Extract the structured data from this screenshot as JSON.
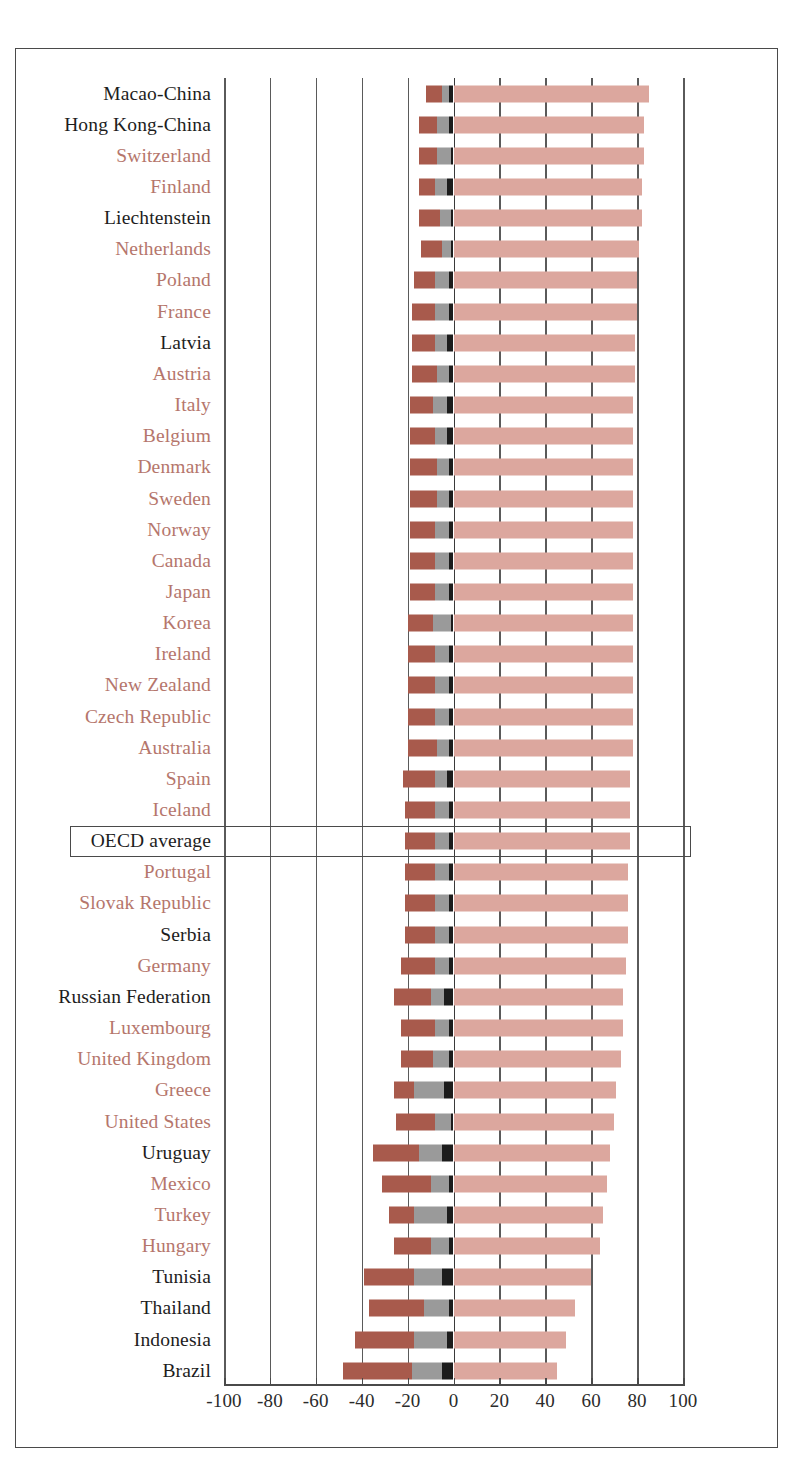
{
  "chart_data": {
    "type": "bar",
    "orientation": "horizontal",
    "stacked": true,
    "diverging": true,
    "title": "",
    "subtitle": "",
    "xlabel": "",
    "ylabel": "",
    "xlim": [
      -100,
      100
    ],
    "xticks": [
      -100,
      -80,
      -60,
      -40,
      -20,
      0,
      20,
      40,
      60,
      80,
      100
    ],
    "xtick_labels": [
      "-100",
      "-80",
      "-60",
      "-40",
      "-20",
      "0",
      "20",
      "40",
      "60",
      "80",
      "100"
    ],
    "grid": true,
    "grid_axis": "x",
    "legend": [],
    "legend_position": "none",
    "series": [
      {
        "name": "below-level-1",
        "color": "#a85a4c",
        "side": "negative"
      },
      {
        "name": "level-1",
        "color": "#9a9a9a",
        "side": "negative"
      },
      {
        "name": "level-2",
        "color": "#1c1c1c",
        "side": "negative"
      },
      {
        "name": "level-3-and-above",
        "color": "#dca79e",
        "side": "positive"
      }
    ],
    "categories": [
      "Macao-China",
      "Hong Kong-China",
      "Switzerland",
      "Finland",
      "Liechtenstein",
      "Netherlands",
      "Poland",
      "France",
      "Latvia",
      "Austria",
      "Italy",
      "Belgium",
      "Denmark",
      "Sweden",
      "Norway",
      "Canada",
      "Japan",
      "Korea",
      "Ireland",
      "New Zealand",
      "Czech Republic",
      "Australia",
      "Spain",
      "Iceland",
      "OECD average",
      "Portugal",
      "Slovak Republic",
      "Serbia",
      "Germany",
      "Russian Federation",
      "Luxembourg",
      "United Kingdom",
      "Greece",
      "United States",
      "Uruguay",
      "Mexico",
      "Turkey",
      "Hungary",
      "Tunisia",
      "Thailand",
      "Indonesia",
      "Brazil"
    ],
    "rows": [
      {
        "name": "Macao-China",
        "member": false,
        "below1": -7,
        "level1": -3,
        "level2": -2,
        "level3plus": 85
      },
      {
        "name": "Hong Kong-China",
        "member": false,
        "below1": -8,
        "level1": -5,
        "level2": -2,
        "level3plus": 83
      },
      {
        "name": "Switzerland",
        "member": true,
        "below1": -8,
        "level1": -6,
        "level2": -1,
        "level3plus": 83
      },
      {
        "name": "Finland",
        "member": true,
        "below1": -7,
        "level1": -5,
        "level2": -3,
        "level3plus": 82
      },
      {
        "name": "Liechtenstein",
        "member": false,
        "below1": -9,
        "level1": -5,
        "level2": -1,
        "level3plus": 82
      },
      {
        "name": "Netherlands",
        "member": true,
        "below1": -9,
        "level1": -4,
        "level2": -1,
        "level3plus": 81
      },
      {
        "name": "Poland",
        "member": true,
        "below1": -9,
        "level1": -6,
        "level2": -2,
        "level3plus": 80
      },
      {
        "name": "France",
        "member": true,
        "below1": -10,
        "level1": -6,
        "level2": -2,
        "level3plus": 80
      },
      {
        "name": "Latvia",
        "member": false,
        "below1": -10,
        "level1": -5,
        "level2": -3,
        "level3plus": 79
      },
      {
        "name": "Austria",
        "member": true,
        "below1": -11,
        "level1": -5,
        "level2": -2,
        "level3plus": 79
      },
      {
        "name": "Italy",
        "member": true,
        "below1": -10,
        "level1": -6,
        "level2": -3,
        "level3plus": 78
      },
      {
        "name": "Belgium",
        "member": true,
        "below1": -11,
        "level1": -5,
        "level2": -3,
        "level3plus": 78
      },
      {
        "name": "Denmark",
        "member": true,
        "below1": -12,
        "level1": -5,
        "level2": -2,
        "level3plus": 78
      },
      {
        "name": "Sweden",
        "member": true,
        "below1": -12,
        "level1": -5,
        "level2": -2,
        "level3plus": 78
      },
      {
        "name": "Norway",
        "member": true,
        "below1": -11,
        "level1": -6,
        "level2": -2,
        "level3plus": 78
      },
      {
        "name": "Canada",
        "member": true,
        "below1": -11,
        "level1": -6,
        "level2": -2,
        "level3plus": 78
      },
      {
        "name": "Japan",
        "member": true,
        "below1": -11,
        "level1": -6,
        "level2": -2,
        "level3plus": 78
      },
      {
        "name": "Korea",
        "member": true,
        "below1": -11,
        "level1": -8,
        "level2": -1,
        "level3plus": 78
      },
      {
        "name": "Ireland",
        "member": true,
        "below1": -12,
        "level1": -6,
        "level2": -2,
        "level3plus": 78
      },
      {
        "name": "New Zealand",
        "member": true,
        "below1": -12,
        "level1": -6,
        "level2": -2,
        "level3plus": 78
      },
      {
        "name": "Czech Republic",
        "member": true,
        "below1": -12,
        "level1": -6,
        "level2": -2,
        "level3plus": 78
      },
      {
        "name": "Australia",
        "member": true,
        "below1": -13,
        "level1": -5,
        "level2": -2,
        "level3plus": 78
      },
      {
        "name": "Spain",
        "member": true,
        "below1": -14,
        "level1": -5,
        "level2": -3,
        "level3plus": 77
      },
      {
        "name": "Iceland",
        "member": true,
        "below1": -13,
        "level1": -6,
        "level2": -2,
        "level3plus": 77
      },
      {
        "name": "OECD average",
        "member": false,
        "average": true,
        "below1": -13,
        "level1": -6,
        "level2": -2,
        "level3plus": 77
      },
      {
        "name": "Portugal",
        "member": true,
        "below1": -13,
        "level1": -6,
        "level2": -2,
        "level3plus": 76
      },
      {
        "name": "Slovak Republic",
        "member": true,
        "below1": -13,
        "level1": -6,
        "level2": -2,
        "level3plus": 76
      },
      {
        "name": "Serbia",
        "member": false,
        "below1": -13,
        "level1": -6,
        "level2": -2,
        "level3plus": 76
      },
      {
        "name": "Germany",
        "member": true,
        "below1": -15,
        "level1": -6,
        "level2": -2,
        "level3plus": 75
      },
      {
        "name": "Russian Federation",
        "member": false,
        "below1": -16,
        "level1": -6,
        "level2": -4,
        "level3plus": 74
      },
      {
        "name": "Luxembourg",
        "member": true,
        "below1": -15,
        "level1": -6,
        "level2": -2,
        "level3plus": 74
      },
      {
        "name": "United Kingdom",
        "member": true,
        "below1": -14,
        "level1": -7,
        "level2": -2,
        "level3plus": 73
      },
      {
        "name": "Greece",
        "member": true,
        "below1": -9,
        "level1": -13,
        "level2": -4,
        "level3plus": 71
      },
      {
        "name": "United States",
        "member": true,
        "below1": -17,
        "level1": -7,
        "level2": -1,
        "level3plus": 70
      },
      {
        "name": "Uruguay",
        "member": false,
        "below1": -20,
        "level1": -10,
        "level2": -5,
        "level3plus": 68
      },
      {
        "name": "Mexico",
        "member": true,
        "below1": -21,
        "level1": -8,
        "level2": -2,
        "level3plus": 67
      },
      {
        "name": "Turkey",
        "member": true,
        "below1": -11,
        "level1": -14,
        "level2": -3,
        "level3plus": 65
      },
      {
        "name": "Hungary",
        "member": true,
        "below1": -16,
        "level1": -8,
        "level2": -2,
        "level3plus": 64
      },
      {
        "name": "Tunisia",
        "member": false,
        "below1": -22,
        "level1": -12,
        "level2": -5,
        "level3plus": 60
      },
      {
        "name": "Thailand",
        "member": false,
        "below1": -24,
        "level1": -11,
        "level2": -2,
        "level3plus": 53
      },
      {
        "name": "Indonesia",
        "member": false,
        "below1": -26,
        "level1": -14,
        "level2": -3,
        "level3plus": 49
      },
      {
        "name": "Brazil",
        "member": false,
        "below1": -30,
        "level1": -13,
        "level2": -5,
        "level3plus": 45
      }
    ]
  }
}
